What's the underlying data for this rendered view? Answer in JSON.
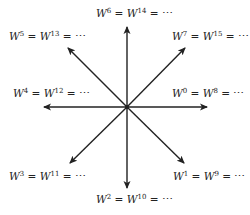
{
  "diagram": {
    "center": {
      "x": 127,
      "y": 107
    },
    "arrows": [
      {
        "name": "arrow-0",
        "tip": [
          207,
          107
        ]
      },
      {
        "name": "arrow-1",
        "tip": [
          184,
          163
        ]
      },
      {
        "name": "arrow-2",
        "tip": [
          127,
          188
        ]
      },
      {
        "name": "arrow-3",
        "tip": [
          70,
          163
        ]
      },
      {
        "name": "arrow-4",
        "tip": [
          44,
          107
        ]
      },
      {
        "name": "arrow-5",
        "tip": [
          68,
          48
        ]
      },
      {
        "name": "arrow-6",
        "tip": [
          127,
          27
        ]
      },
      {
        "name": "arrow-7",
        "tip": [
          185,
          48
        ]
      }
    ],
    "labels": [
      {
        "base": "W",
        "exp1": "0",
        "exp2": "8",
        "tail": " = ⋯",
        "x": 172,
        "y": 87
      },
      {
        "base": "W",
        "exp1": "1",
        "exp2": "9",
        "tail": " = ⋯",
        "x": 173,
        "y": 170
      },
      {
        "base": "W",
        "exp1": "2",
        "exp2": "10",
        "tail": " = ⋯",
        "x": 96,
        "y": 193
      },
      {
        "base": "W",
        "exp1": "3",
        "exp2": "11",
        "tail": " = ⋯",
        "x": 9,
        "y": 170
      },
      {
        "base": "W",
        "exp1": "4",
        "exp2": "12",
        "tail": " = ⋯",
        "x": 13,
        "y": 87
      },
      {
        "base": "W",
        "exp1": "5",
        "exp2": "13",
        "tail": " = ⋯",
        "x": 9,
        "y": 30
      },
      {
        "base": "W",
        "exp1": "6",
        "exp2": "14",
        "tail": " = ⋯",
        "x": 96,
        "y": 7
      },
      {
        "base": "W",
        "exp1": "7",
        "exp2": "15",
        "tail": " = ⋯",
        "x": 172,
        "y": 30
      }
    ],
    "stroke_color": "#222222"
  }
}
